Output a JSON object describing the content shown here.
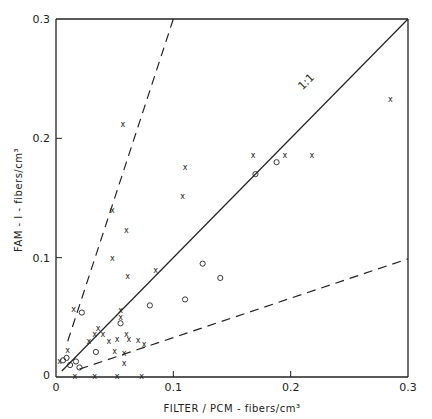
{
  "chart_data": {
    "type": "scatter",
    "title": "",
    "xlabel": "FILTER / PCM - fibers/cm³",
    "ylabel": "FAM - I - fibers/cm³",
    "xlim": [
      0,
      0.3
    ],
    "ylim": [
      0,
      0.3
    ],
    "xticks": [
      "0",
      "0.1",
      "0.2",
      "0.3"
    ],
    "yticks": [
      "0",
      "0.1",
      "0.2",
      "0.3"
    ],
    "grid": false,
    "legend": "none",
    "annotations": [
      {
        "text": "1:1",
        "x": 0.21,
        "y": 0.24
      }
    ],
    "reference_lines": [
      {
        "name": "1:1",
        "style": "solid",
        "slope": 1.0
      },
      {
        "name": "upper bound",
        "style": "dashed",
        "slope": 3.0
      },
      {
        "name": "lower bound",
        "style": "dashed",
        "slope": 0.33
      }
    ],
    "series": [
      {
        "name": "x markers",
        "marker": "x",
        "points": [
          [
            0.003,
            0.013
          ],
          [
            0.01,
            0.023
          ],
          [
            0.028,
            0.03
          ],
          [
            0.033,
            0.036
          ],
          [
            0.036,
            0.041
          ],
          [
            0.04,
            0.036
          ],
          [
            0.045,
            0.03
          ],
          [
            0.05,
            0.022
          ],
          [
            0.052,
            0.032
          ],
          [
            0.055,
            0.05
          ],
          [
            0.055,
            0.056
          ],
          [
            0.06,
            0.036
          ],
          [
            0.062,
            0.032
          ],
          [
            0.07,
            0.031
          ],
          [
            0.075,
            0.028
          ],
          [
            0.058,
            0.012
          ],
          [
            0.058,
            0.02
          ],
          [
            0.016,
            0.001
          ],
          [
            0.033,
            0.001
          ],
          [
            0.052,
            0.001
          ],
          [
            0.073,
            0.001
          ],
          [
            0.048,
            0.1
          ],
          [
            0.048,
            0.14
          ],
          [
            0.057,
            0.212
          ],
          [
            0.06,
            0.123
          ],
          [
            0.061,
            0.085
          ],
          [
            0.085,
            0.09
          ],
          [
            0.108,
            0.152
          ],
          [
            0.11,
            0.176
          ],
          [
            0.168,
            0.186
          ],
          [
            0.195,
            0.186
          ],
          [
            0.218,
            0.186
          ],
          [
            0.285,
            0.233
          ],
          [
            0.015,
            0.057
          ]
        ]
      },
      {
        "name": "o markers",
        "marker": "o",
        "points": [
          [
            0.006,
            0.014
          ],
          [
            0.009,
            0.016
          ],
          [
            0.012,
            0.01
          ],
          [
            0.017,
            0.013
          ],
          [
            0.02,
            0.008
          ],
          [
            0.022,
            0.054
          ],
          [
            0.034,
            0.021
          ],
          [
            0.055,
            0.045
          ],
          [
            0.08,
            0.06
          ],
          [
            0.11,
            0.065
          ],
          [
            0.125,
            0.095
          ],
          [
            0.14,
            0.083
          ],
          [
            0.17,
            0.17
          ],
          [
            0.188,
            0.18
          ]
        ]
      }
    ]
  }
}
